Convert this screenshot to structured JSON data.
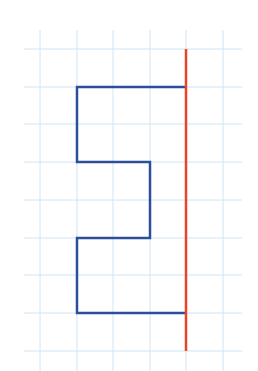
{
  "diagram": {
    "type": "grid-path",
    "colors": {
      "background": "#ffffff",
      "grid": "#cfe6f2",
      "path": "#2b4f9e",
      "axis_line": "#e8442c"
    },
    "grid": {
      "vertical_x": [
        40,
        77,
        113,
        150,
        186,
        223
      ],
      "horizontal_y": [
        49,
        87,
        124,
        162,
        200,
        238,
        275,
        313,
        351
      ],
      "v_extent": [
        30,
        371
      ],
      "h_extent": [
        24,
        242
      ]
    },
    "path_points": [
      [
        186,
        87
      ],
      [
        77,
        87
      ],
      [
        77,
        162
      ],
      [
        150,
        162
      ],
      [
        150,
        238
      ],
      [
        77,
        238
      ],
      [
        77,
        313
      ],
      [
        186,
        313
      ]
    ],
    "vertical_line": {
      "x": 186,
      "y1": 49,
      "y2": 351
    }
  }
}
